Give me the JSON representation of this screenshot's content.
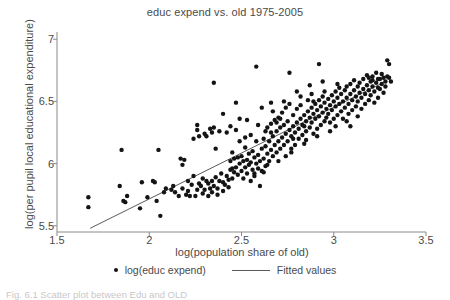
{
  "figure": {
    "caption": "Fig. 6.1  Scatter plot between Edu and OLD"
  },
  "chart_data": {
    "type": "scatter",
    "title": "educ expend vs. old 1975-2005",
    "xlabel": "log(population share of old)",
    "ylabel": "log(per pupil local educational expenditure)",
    "xlim": [
      1.5,
      3.5
    ],
    "ylim": [
      5.45,
      7.05
    ],
    "xticks": [
      1.5,
      2,
      2.5,
      3,
      3.5
    ],
    "xtick_labels": [
      "1.5",
      "2",
      "2.5",
      "3",
      "3.5"
    ],
    "yticks": [
      5.5,
      6,
      6.5,
      7
    ],
    "ytick_labels": [
      "5.5",
      "6",
      "6.5",
      "7"
    ],
    "grid": false,
    "legend_position": "bottom",
    "legend": [
      {
        "label": "log(educ expend)",
        "marker": "dot",
        "color": "#141414"
      },
      {
        "label": "Fitted values",
        "marker": "line",
        "color": "#5a5a5a"
      }
    ],
    "series": [
      {
        "name": "log(educ expend)",
        "type": "scatter",
        "marker": "filled-circle",
        "color": "#141414",
        "points": [
          [
            1.67,
            5.73
          ],
          [
            1.67,
            5.65
          ],
          [
            1.84,
            5.82
          ],
          [
            1.85,
            6.11
          ],
          [
            1.86,
            5.7
          ],
          [
            1.87,
            5.69
          ],
          [
            1.88,
            5.74
          ],
          [
            1.95,
            5.64
          ],
          [
            1.96,
            5.85
          ],
          [
            1.99,
            5.73
          ],
          [
            2.02,
            5.86
          ],
          [
            2.03,
            5.85
          ],
          [
            2.04,
            5.7
          ],
          [
            2.05,
            6.11
          ],
          [
            2.06,
            5.58
          ],
          [
            2.08,
            5.77
          ],
          [
            2.09,
            5.8
          ],
          [
            2.12,
            5.79
          ],
          [
            2.14,
            5.77
          ],
          [
            2.16,
            5.74
          ],
          [
            2.17,
            6.04
          ],
          [
            2.18,
            5.99
          ],
          [
            2.19,
            6.03
          ],
          [
            2.2,
            5.75
          ],
          [
            2.21,
            5.86
          ],
          [
            2.22,
            5.74
          ],
          [
            2.23,
            5.83
          ],
          [
            2.24,
            5.9
          ],
          [
            2.25,
            5.74
          ],
          [
            2.26,
            6.27
          ],
          [
            2.26,
            6.31
          ],
          [
            2.27,
            5.84
          ],
          [
            2.28,
            5.82
          ],
          [
            2.29,
            5.88
          ],
          [
            2.3,
            5.79
          ],
          [
            2.31,
            5.86
          ],
          [
            2.31,
            6.22
          ],
          [
            2.32,
            5.84
          ],
          [
            2.33,
            5.8
          ],
          [
            2.33,
            6.28
          ],
          [
            2.34,
            5.86
          ],
          [
            2.34,
            6.25
          ],
          [
            2.35,
            5.82
          ],
          [
            2.35,
            6.65
          ],
          [
            2.36,
            5.89
          ],
          [
            2.36,
            6.12
          ],
          [
            2.37,
            5.75
          ],
          [
            2.38,
            5.86
          ],
          [
            2.39,
            5.92
          ],
          [
            2.4,
            5.85
          ],
          [
            2.4,
            6.4
          ],
          [
            2.41,
            5.83
          ],
          [
            2.42,
            5.9
          ],
          [
            2.42,
            6.25
          ],
          [
            2.43,
            5.87
          ],
          [
            2.44,
            5.95
          ],
          [
            2.44,
            6.02
          ],
          [
            2.45,
            5.88
          ],
          [
            2.45,
            6.09
          ],
          [
            2.46,
            5.93
          ],
          [
            2.46,
            6.04
          ],
          [
            2.47,
            5.97
          ],
          [
            2.47,
            6.49
          ],
          [
            2.48,
            5.91
          ],
          [
            2.48,
            6.05
          ],
          [
            2.49,
            6.0
          ],
          [
            2.49,
            6.36
          ],
          [
            2.5,
            5.94
          ],
          [
            2.5,
            6.06
          ],
          [
            2.51,
            5.88
          ],
          [
            2.51,
            6.02
          ],
          [
            2.52,
            5.97
          ],
          [
            2.52,
            6.13
          ],
          [
            2.53,
            5.92
          ],
          [
            2.53,
            6.03
          ],
          [
            2.54,
            5.99
          ],
          [
            2.54,
            6.08
          ],
          [
            2.55,
            5.86
          ],
          [
            2.55,
            6.01
          ],
          [
            2.56,
            5.95
          ],
          [
            2.56,
            6.1
          ],
          [
            2.57,
            5.9
          ],
          [
            2.57,
            6.05
          ],
          [
            2.58,
            6.0
          ],
          [
            2.58,
            6.78
          ],
          [
            2.59,
            5.96
          ],
          [
            2.59,
            6.07
          ],
          [
            2.6,
            5.82
          ],
          [
            2.6,
            6.02
          ],
          [
            2.61,
            5.94
          ],
          [
            2.61,
            6.12
          ],
          [
            2.62,
            6.04
          ],
          [
            2.62,
            6.2
          ],
          [
            2.63,
            5.98
          ],
          [
            2.63,
            6.14
          ],
          [
            2.64,
            6.08
          ],
          [
            2.64,
            6.29
          ],
          [
            2.65,
            6.02
          ],
          [
            2.65,
            6.18
          ],
          [
            2.66,
            6.11
          ],
          [
            2.66,
            6.32
          ],
          [
            2.67,
            6.06
          ],
          [
            2.67,
            6.22
          ],
          [
            2.68,
            6.15
          ],
          [
            2.68,
            6.35
          ],
          [
            2.69,
            6.09
          ],
          [
            2.69,
            6.26
          ],
          [
            2.7,
            6.18
          ],
          [
            2.7,
            6.37
          ],
          [
            2.71,
            6.12
          ],
          [
            2.71,
            6.29
          ],
          [
            2.72,
            6.21
          ],
          [
            2.72,
            6.41
          ],
          [
            2.73,
            6.15
          ],
          [
            2.73,
            6.31
          ],
          [
            2.74,
            6.24
          ],
          [
            2.74,
            6.45
          ],
          [
            2.75,
            6.18
          ],
          [
            2.75,
            6.34
          ],
          [
            2.76,
            6.27
          ],
          [
            2.76,
            6.48
          ],
          [
            2.76,
            6.73
          ],
          [
            2.77,
            6.09
          ],
          [
            2.77,
            6.22
          ],
          [
            2.78,
            6.3
          ],
          [
            2.78,
            6.39
          ],
          [
            2.79,
            6.15
          ],
          [
            2.79,
            6.25
          ],
          [
            2.8,
            6.33
          ],
          [
            2.8,
            6.44
          ],
          [
            2.81,
            6.2
          ],
          [
            2.81,
            6.28
          ],
          [
            2.82,
            6.36
          ],
          [
            2.82,
            6.47
          ],
          [
            2.83,
            6.23
          ],
          [
            2.83,
            6.31
          ],
          [
            2.84,
            6.39
          ],
          [
            2.84,
            6.3
          ],
          [
            2.85,
            6.26
          ],
          [
            2.85,
            6.34
          ],
          [
            2.86,
            6.42
          ],
          [
            2.86,
            6.51
          ],
          [
            2.87,
            6.29
          ],
          [
            2.87,
            6.37
          ],
          [
            2.88,
            6.45
          ],
          [
            2.88,
            6.33
          ],
          [
            2.89,
            6.24
          ],
          [
            2.89,
            6.4
          ],
          [
            2.9,
            6.48
          ],
          [
            2.9,
            6.36
          ],
          [
            2.91,
            6.28
          ],
          [
            2.91,
            6.43
          ],
          [
            2.92,
            6.51
          ],
          [
            2.92,
            6.38
          ],
          [
            2.92,
            6.8
          ],
          [
            2.93,
            6.31
          ],
          [
            2.93,
            6.46
          ],
          [
            2.94,
            6.54
          ],
          [
            2.94,
            6.41
          ],
          [
            2.95,
            6.34
          ],
          [
            2.95,
            6.49
          ],
          [
            2.96,
            6.44
          ],
          [
            2.96,
            6.37
          ],
          [
            2.97,
            6.52
          ],
          [
            2.97,
            6.4
          ],
          [
            2.98,
            6.47
          ],
          [
            2.98,
            6.33
          ],
          [
            2.99,
            6.55
          ],
          [
            2.99,
            6.43
          ],
          [
            3.0,
            6.5
          ],
          [
            3.0,
            6.36
          ],
          [
            3.01,
            6.58
          ],
          [
            3.01,
            6.46
          ],
          [
            3.02,
            6.39
          ],
          [
            3.02,
            6.53
          ],
          [
            3.03,
            6.48
          ],
          [
            3.03,
            6.61
          ],
          [
            3.04,
            6.42
          ],
          [
            3.04,
            6.56
          ],
          [
            3.05,
            6.5
          ],
          [
            3.05,
            6.36
          ],
          [
            3.06,
            6.59
          ],
          [
            3.06,
            6.45
          ],
          [
            3.07,
            6.53
          ],
          [
            3.07,
            6.62
          ],
          [
            3.08,
            6.48
          ],
          [
            3.08,
            6.4
          ],
          [
            3.09,
            6.56
          ],
          [
            3.09,
            6.64
          ],
          [
            3.1,
            6.51
          ],
          [
            3.1,
            6.43
          ],
          [
            3.11,
            6.59
          ],
          [
            3.11,
            6.67
          ],
          [
            3.12,
            6.54
          ],
          [
            3.12,
            6.46
          ],
          [
            3.13,
            6.62
          ],
          [
            3.13,
            6.5
          ],
          [
            3.14,
            6.57
          ],
          [
            3.14,
            6.65
          ],
          [
            3.15,
            6.53
          ],
          [
            3.15,
            6.44
          ],
          [
            3.16,
            6.6
          ],
          [
            3.16,
            6.68
          ],
          [
            3.17,
            6.56
          ],
          [
            3.17,
            6.48
          ],
          [
            3.18,
            6.63
          ],
          [
            3.18,
            6.71
          ],
          [
            3.19,
            6.59
          ],
          [
            3.19,
            6.51
          ],
          [
            3.2,
            6.66
          ],
          [
            3.2,
            6.55
          ],
          [
            3.21,
            6.62
          ],
          [
            3.21,
            6.7
          ],
          [
            3.22,
            6.58
          ],
          [
            3.22,
            6.49
          ],
          [
            3.23,
            6.65
          ],
          [
            3.23,
            6.73
          ],
          [
            3.24,
            6.61
          ],
          [
            3.24,
            6.53
          ],
          [
            3.25,
            6.68
          ],
          [
            3.25,
            6.6
          ],
          [
            3.26,
            6.64
          ],
          [
            3.26,
            6.72
          ],
          [
            3.27,
            6.57
          ],
          [
            3.27,
            6.69
          ],
          [
            3.28,
            6.66
          ],
          [
            3.28,
            6.62
          ],
          [
            3.29,
            6.83
          ],
          [
            3.3,
            6.8
          ],
          [
            3.3,
            6.69
          ],
          [
            3.31,
            6.66
          ],
          [
            3.29,
            6.7
          ],
          [
            3.24,
            6.68
          ],
          [
            3.21,
            6.67
          ],
          [
            3.19,
            6.69
          ],
          [
            2.66,
            6.25
          ],
          [
            2.71,
            6.36
          ],
          [
            2.78,
            6.2
          ],
          [
            2.85,
            6.19
          ],
          [
            2.88,
            6.56
          ],
          [
            2.74,
            6.06
          ],
          [
            2.62,
            5.93
          ],
          [
            2.55,
            6.23
          ],
          [
            2.49,
            6.18
          ],
          [
            2.44,
            6.3
          ],
          [
            2.38,
            6.26
          ],
          [
            2.35,
            6.29
          ],
          [
            2.3,
            6.24
          ],
          [
            2.27,
            6.22
          ],
          [
            2.24,
            6.2
          ],
          [
            2.58,
            6.18
          ],
          [
            2.63,
            6.26
          ],
          [
            2.69,
            6.33
          ],
          [
            2.52,
            6.21
          ],
          [
            2.47,
            6.27
          ],
          [
            2.43,
            5.81
          ],
          [
            2.4,
            5.78
          ],
          [
            2.37,
            5.8
          ],
          [
            2.34,
            5.77
          ],
          [
            2.32,
            5.74
          ],
          [
            2.29,
            5.76
          ],
          [
            2.26,
            5.79
          ],
          [
            2.21,
            5.78
          ],
          [
            2.18,
            5.8
          ],
          [
            2.13,
            5.82
          ],
          [
            2.67,
            6.42
          ],
          [
            2.73,
            6.5
          ],
          [
            2.8,
            6.58
          ],
          [
            2.87,
            6.63
          ],
          [
            2.94,
            6.66
          ],
          [
            3.01,
            6.3
          ],
          [
            3.07,
            6.34
          ],
          [
            3.13,
            6.38
          ],
          [
            2.98,
            6.26
          ],
          [
            2.91,
            6.22
          ],
          [
            2.84,
            6.16
          ],
          [
            2.77,
            6.12
          ],
          [
            2.7,
            6.02
          ],
          [
            2.64,
            5.99
          ],
          [
            2.57,
            5.92
          ],
          [
            3.02,
            6.64
          ],
          [
            3.09,
            6.3
          ],
          [
            2.95,
            6.58
          ],
          [
            2.89,
            6.5
          ],
          [
            2.82,
            6.54
          ],
          [
            2.59,
            6.31
          ],
          [
            2.53,
            6.35
          ],
          [
            2.61,
            6.45
          ],
          [
            2.66,
            6.49
          ],
          [
            2.45,
            5.96
          ]
        ]
      },
      {
        "name": "Fitted values",
        "type": "line",
        "color": "#5a5a5a",
        "x": [
          1.68,
          3.28
        ],
        "y": [
          5.48,
          6.66
        ]
      }
    ]
  }
}
